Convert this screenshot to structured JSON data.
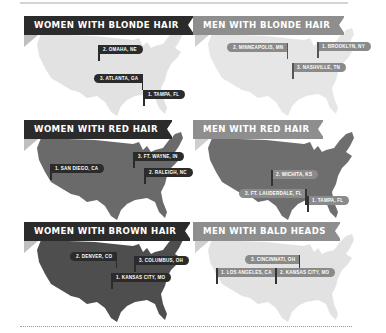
{
  "colors": {
    "dark_banner": "#2b2b2b",
    "light_banner": "#8e8e8e",
    "light_map": "#e2e2e2",
    "dark_map": "#6a6a6a",
    "darker_map": "#4e4e4e",
    "dark_pin": "#2b2b2b",
    "light_pin": "#8a8a8a"
  },
  "panels": [
    {
      "title": "WOMEN WITH BLONDE HAIR",
      "pins": [
        "2. OMAHA, NE",
        "3. ATLANTA, GA",
        "1. TAMPA, FL"
      ]
    },
    {
      "title": "MEN WITH BLONDE HAIR",
      "pins": [
        "2. MINNEAPOLIS, MN",
        "1. BROOKLYN, NY",
        "3. NASHVILLE, TN"
      ]
    },
    {
      "title": "WOMEN WITH RED HAIR",
      "pins": [
        "1. SAN DIEGO, CA",
        "3. FT. WAYNE, IN",
        "2. RALEIGH, NC"
      ]
    },
    {
      "title": "MEN WITH RED HAIR",
      "pins": [
        "2. WICHITA, KS",
        "3. FT. LAUDERDALE, FL",
        "1. TAMPA, FL"
      ]
    },
    {
      "title": "WOMEN WITH BROWN HAIR",
      "pins": [
        "2. DENVER, CO",
        "3. COLUMBUS, OH",
        "1. KANSAS CITY, MO"
      ]
    },
    {
      "title": "MEN WITH BALD HEADS",
      "pins": [
        "3. CINCINNATI, OH",
        "1. LOS ANGELES, CA",
        "2. KANSAS CITY, MO"
      ]
    }
  ]
}
